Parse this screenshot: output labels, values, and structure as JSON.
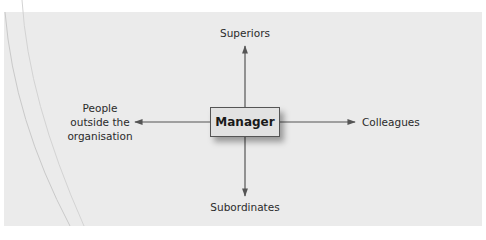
{
  "diagram": {
    "center": {
      "label": "Manager"
    },
    "nodes": {
      "top": {
        "label": "Superiors"
      },
      "right": {
        "label": "Colleagues"
      },
      "bottom": {
        "label": "Subordinates"
      },
      "left": {
        "lines": [
          "People",
          "outside the",
          "organisation"
        ]
      }
    },
    "colors": {
      "panel": "#ebebeb",
      "box_fill": "#e2e2e2",
      "arrow": "#555555",
      "text": "#2a2a2a"
    }
  }
}
